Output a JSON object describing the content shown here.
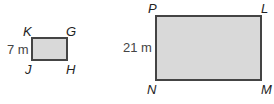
{
  "figures": {
    "small": {
      "vertices": {
        "top_left": "K",
        "top_right": "G",
        "bottom_left": "J",
        "bottom_right": "H"
      },
      "side_label": "7 m"
    },
    "large": {
      "vertices": {
        "top_left": "P",
        "top_right": "L",
        "bottom_left": "N",
        "bottom_right": "M"
      },
      "side_label": "21 m"
    }
  },
  "colors": {
    "fill": "#d9d9d9",
    "stroke": "#444444"
  }
}
